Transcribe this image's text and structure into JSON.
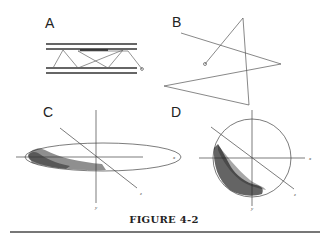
{
  "figure": {
    "caption": "FIGURE 4-2",
    "panels": [
      {
        "id": "A",
        "label": "A",
        "description": "Two pairs of parallel lines with a zig-zag path bouncing between them, ending in a small circle"
      },
      {
        "id": "B",
        "label": "B",
        "description": "Star-like polygonal path starting from a small circle"
      },
      {
        "id": "C",
        "label": "C",
        "description": "Flattened ellipse with x, y, z axes; stippled shading along lower-left edge",
        "axes": {
          "x": "x",
          "y": "y",
          "z": "z"
        }
      },
      {
        "id": "D",
        "label": "D",
        "description": "Circle with x, y, z axes; heavy stippled shading in lower-left quadrant",
        "axes": {
          "x": "x",
          "y": "y",
          "z": "z"
        }
      }
    ]
  },
  "colors": {
    "line": "#444444",
    "stipple": "#333333",
    "rule": "#777777"
  }
}
